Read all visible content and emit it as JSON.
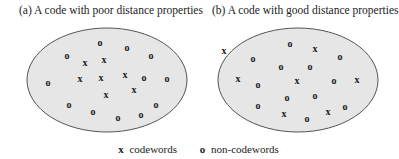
{
  "panels": [
    {
      "id": "a",
      "title": "(a) A code with poor distance properties",
      "ellipse": {
        "cx": 107,
        "cy": 80,
        "rx": 80,
        "ry": 52
      },
      "points": [
        {
          "t": "o",
          "x": 100,
          "y": 42
        },
        {
          "t": "o",
          "x": 127,
          "y": 47
        },
        {
          "t": "o",
          "x": 67,
          "y": 55
        },
        {
          "t": "o",
          "x": 151,
          "y": 55
        },
        {
          "t": "x",
          "x": 85,
          "y": 62
        },
        {
          "t": "x",
          "x": 104,
          "y": 59
        },
        {
          "t": "x",
          "x": 80,
          "y": 78
        },
        {
          "t": "x",
          "x": 101,
          "y": 77
        },
        {
          "t": "x",
          "x": 125,
          "y": 74
        },
        {
          "t": "o",
          "x": 144,
          "y": 77
        },
        {
          "t": "o",
          "x": 167,
          "y": 78
        },
        {
          "t": "o",
          "x": 48,
          "y": 82
        },
        {
          "t": "x",
          "x": 106,
          "y": 94
        },
        {
          "t": "x",
          "x": 134,
          "y": 89
        },
        {
          "t": "o",
          "x": 69,
          "y": 104
        },
        {
          "t": "o",
          "x": 156,
          "y": 104
        },
        {
          "t": "o",
          "x": 93,
          "y": 111
        },
        {
          "t": "o",
          "x": 141,
          "y": 114
        },
        {
          "t": "o",
          "x": 118,
          "y": 117
        }
      ]
    },
    {
      "id": "b",
      "title": "(b) A code with good distance properties",
      "ellipse": {
        "cx": 298,
        "cy": 80,
        "rx": 80,
        "ry": 52
      },
      "points": [
        {
          "t": "o",
          "x": 290,
          "y": 43
        },
        {
          "t": "x",
          "x": 224,
          "y": 50
        },
        {
          "t": "x",
          "x": 315,
          "y": 48
        },
        {
          "t": "o",
          "x": 253,
          "y": 58
        },
        {
          "t": "o",
          "x": 340,
          "y": 56
        },
        {
          "t": "o",
          "x": 281,
          "y": 66
        },
        {
          "t": "o",
          "x": 310,
          "y": 66
        },
        {
          "t": "x",
          "x": 238,
          "y": 78
        },
        {
          "t": "o",
          "x": 258,
          "y": 84
        },
        {
          "t": "x",
          "x": 297,
          "y": 80
        },
        {
          "t": "o",
          "x": 334,
          "y": 80
        },
        {
          "t": "x",
          "x": 357,
          "y": 79
        },
        {
          "t": "o",
          "x": 287,
          "y": 97
        },
        {
          "t": "o",
          "x": 315,
          "y": 95
        },
        {
          "t": "o",
          "x": 258,
          "y": 105
        },
        {
          "t": "x",
          "x": 284,
          "y": 113
        },
        {
          "t": "o",
          "x": 307,
          "y": 118
        },
        {
          "t": "x",
          "x": 328,
          "y": 111
        },
        {
          "t": "o",
          "x": 345,
          "y": 106
        }
      ]
    }
  ],
  "legend": {
    "codeword_glyph": "x",
    "codeword_label": "codewords",
    "noncodeword_glyph": "o",
    "noncodeword_label": "non-codewords"
  },
  "colors": {
    "ellipse_fill": "#e6e6e6",
    "ellipse_stroke": "#555555",
    "symbol": "#1a1a1a"
  }
}
